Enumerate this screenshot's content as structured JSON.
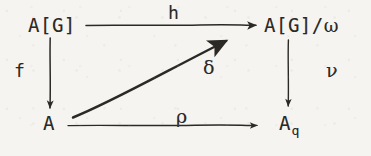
{
  "diagram": {
    "kind": "commutative-diagram",
    "ink_color": "#2b2926",
    "paper_color": "#f6f4f0",
    "nodes": {
      "top_left": {
        "label": "A[G]",
        "x": 28,
        "y": 16
      },
      "top_right": {
        "label": "A[G]/",
        "greek": "ω",
        "x": 264,
        "y": 16
      },
      "bottom_left": {
        "label": "A",
        "x": 43,
        "y": 114
      },
      "bottom_right": {
        "label": "A",
        "subscript": "q",
        "x": 279,
        "y": 114
      }
    },
    "arrows": [
      {
        "name": "h",
        "label": "h",
        "from": "top_left",
        "to": "top_right",
        "orientation": "horizontal-top",
        "label_x": 168,
        "label_y": 4,
        "is_greek": false
      },
      {
        "name": "f",
        "label": "f",
        "from": "top_left",
        "to": "bottom_left",
        "orientation": "vertical-left",
        "label_x": 14,
        "label_y": 62,
        "is_greek": false
      },
      {
        "name": "nu",
        "label": "ν",
        "from": "top_right",
        "to": "bottom_right",
        "orientation": "vertical-right",
        "label_x": 326,
        "label_y": 61,
        "is_greek": true
      },
      {
        "name": "rho",
        "label": "ρ",
        "from": "bottom_left",
        "to": "bottom_right",
        "orientation": "horizontal-bottom",
        "label_x": 176,
        "label_y": 107,
        "is_greek": true
      },
      {
        "name": "delta",
        "label": "δ",
        "from": "bottom_left",
        "to": "top_right",
        "orientation": "diagonal",
        "label_x": 203,
        "label_y": 58,
        "is_greek": true
      }
    ]
  }
}
